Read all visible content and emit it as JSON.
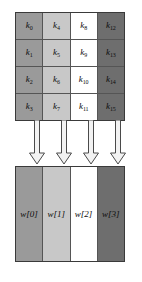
{
  "figure": {
    "background": "#ffffff"
  },
  "palette": {
    "column_0": "#9a9a9a",
    "column_1": "#c8c8c8",
    "column_2": "#ffffff",
    "column_3": "#6e6e6e",
    "outer_border": "#3a3a3a",
    "inner_border": "#555555",
    "text": "#0d0d0d",
    "arrow_fill": "#f2f2f2",
    "arrow_stroke": "#4a4a4a"
  },
  "key_matrix": {
    "rows": 4,
    "columns": 4,
    "order": "column-major",
    "columns_data": [
      {
        "fill": "#9a9a9a",
        "cells": [
          {
            "symbol": "k",
            "index": "0"
          },
          {
            "symbol": "k",
            "index": "1"
          },
          {
            "symbol": "k",
            "index": "2"
          },
          {
            "symbol": "k",
            "index": "3"
          }
        ]
      },
      {
        "fill": "#c8c8c8",
        "cells": [
          {
            "symbol": "k",
            "index": "4"
          },
          {
            "symbol": "k",
            "index": "5"
          },
          {
            "symbol": "k",
            "index": "6"
          },
          {
            "symbol": "k",
            "index": "7"
          }
        ]
      },
      {
        "fill": "#ffffff",
        "cells": [
          {
            "symbol": "k",
            "index": "8"
          },
          {
            "symbol": "k",
            "index": "9"
          },
          {
            "symbol": "k",
            "index": "10"
          },
          {
            "symbol": "k",
            "index": "11"
          }
        ]
      },
      {
        "fill": "#6e6e6e",
        "cells": [
          {
            "symbol": "k",
            "index": "12"
          },
          {
            "symbol": "k",
            "index": "13"
          },
          {
            "symbol": "k",
            "index": "14"
          },
          {
            "symbol": "k",
            "index": "15"
          }
        ]
      }
    ]
  },
  "arrows": {
    "count": 4,
    "direction": "down",
    "style": "hollow-block-arrow",
    "items": [
      {
        "name": "arrow-to-w0",
        "left": 13
      },
      {
        "name": "arrow-to-w1",
        "left": 40
      },
      {
        "name": "arrow-to-w2",
        "left": 67
      },
      {
        "name": "arrow-to-w3",
        "left": 94
      }
    ]
  },
  "word_bar": {
    "columns_data": [
      {
        "label": "w[0]",
        "fill": "#9a9a9a"
      },
      {
        "label": "w[1]",
        "fill": "#c8c8c8"
      },
      {
        "label": "w[2]",
        "fill": "#ffffff"
      },
      {
        "label": "w[3]",
        "fill": "#6e6e6e"
      }
    ]
  }
}
